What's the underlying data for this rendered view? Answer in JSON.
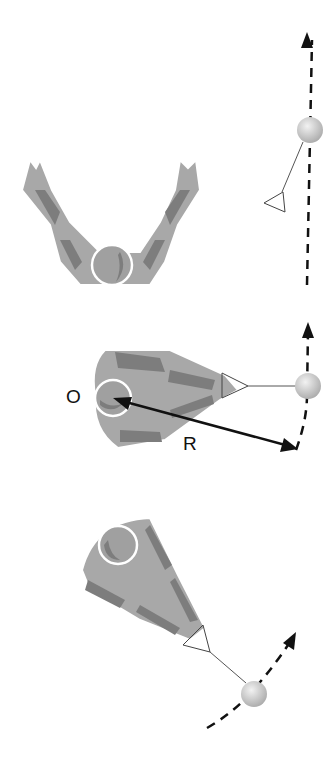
{
  "diagram": {
    "panels": [
      {
        "id": "panel-1",
        "description": "athlete arms spread, hammer ball moving straight up along dashed path"
      },
      {
        "id": "panel-2",
        "description": "athlete holding handle, hammer rotating about center O with radius R",
        "labels": {
          "center": "O",
          "radius": "R"
        }
      },
      {
        "id": "panel-3",
        "description": "athlete rotated, hammer ball moving along curved dashed path"
      }
    ],
    "colors": {
      "body": "#a8a8a8",
      "body_dark": "#7d7d7d",
      "outline": "#ffffff",
      "arrow": "#111111",
      "ball": "#c8c8c8",
      "wire": "#555555"
    }
  },
  "labels": {
    "center": "O",
    "radius": "R"
  }
}
